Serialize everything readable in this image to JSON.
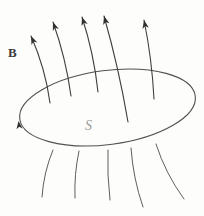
{
  "diagram": {
    "labels": {
      "field": "B",
      "surface": "S"
    },
    "colors": {
      "background": "#fdfdfc",
      "field_line": "#3f3f3f",
      "lower_field_line": "#5c5c5c",
      "ellipse": "#515151",
      "arrowhead": "#2f2f2f",
      "field_label": "#3c3c3c",
      "surface_label": "#9b9b9b"
    },
    "ellipse": {
      "cx": 107.5,
      "cy": 107.5,
      "rx": 88.5,
      "ry": 37,
      "rotation": -7.5
    },
    "field_lines_above": [
      {
        "base_x": 50,
        "base_y": 103,
        "tip_x": 31,
        "tip_y": 36,
        "bend": 5
      },
      {
        "base_x": 71,
        "base_y": 96,
        "tip_x": 53,
        "tip_y": 22,
        "bend": 4
      },
      {
        "base_x": 98,
        "base_y": 92,
        "tip_x": 82,
        "tip_y": 17,
        "bend": 4
      },
      {
        "base_x": 128,
        "base_y": 122,
        "tip_x": 104,
        "tip_y": 16,
        "bend": 3
      },
      {
        "base_x": 154,
        "base_y": 99,
        "tip_x": 144,
        "tip_y": 20,
        "bend": 3
      }
    ],
    "field_lines_below": [
      {
        "top_x": 53,
        "top_y": 150,
        "bottom_x": 42,
        "bottom_y": 197,
        "bend": 4
      },
      {
        "top_x": 79,
        "top_y": 151,
        "bottom_x": 75,
        "bottom_y": 198,
        "bend": 3
      },
      {
        "top_x": 108,
        "top_y": 150,
        "bottom_x": 110,
        "bottom_y": 200,
        "bend": 2
      },
      {
        "top_x": 131,
        "top_y": 148,
        "bottom_x": 143,
        "bottom_y": 207,
        "bend": 4
      },
      {
        "top_x": 156,
        "top_y": 144,
        "bottom_x": 184,
        "bottom_y": 199,
        "bend": 5
      }
    ],
    "boundary_arrow": {
      "x": 18.5,
      "y": 121,
      "angle": -97.5,
      "size": 8
    },
    "arrowhead_size": 8.5,
    "line_width": 1.1
  }
}
